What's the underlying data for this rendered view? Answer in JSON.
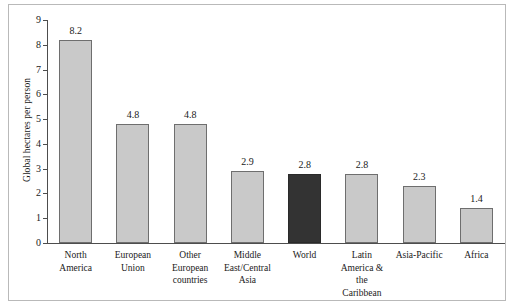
{
  "chart_data": {
    "type": "bar",
    "title": "",
    "xlabel": "",
    "ylabel": "Global hectares per person",
    "ylim": [
      0,
      9
    ],
    "yticks": [
      0,
      1,
      2,
      3,
      4,
      5,
      6,
      7,
      8,
      9
    ],
    "grid": false,
    "legend": "none",
    "categories": [
      "North America",
      "European Union",
      "Other European countries",
      "Middle East/Central Asia",
      "World",
      "Latin America & the Caribbean",
      "Asia-Pacific",
      "Africa"
    ],
    "category_lines": [
      [
        "North",
        "America"
      ],
      [
        "European",
        "Union"
      ],
      [
        "Other",
        "European",
        "countries"
      ],
      [
        "Middle",
        "East/Central",
        "Asia"
      ],
      [
        "World"
      ],
      [
        "Latin",
        "America &",
        "the",
        "Caribbean"
      ],
      [
        "Asia-Pacific"
      ],
      [
        "Africa"
      ]
    ],
    "values": [
      8.2,
      4.8,
      4.8,
      2.9,
      2.8,
      2.8,
      2.3,
      1.4
    ],
    "value_labels": [
      "8.2",
      "4.8",
      "4.8",
      "2.9",
      "2.8",
      "2.8",
      "2.3",
      "1.4"
    ],
    "highlight_index": 4,
    "colors": {
      "bar": "#c9c9c9",
      "bar_border": "#6e6e6e",
      "bar_highlight": "#333333",
      "axis": "#4d4d4d",
      "text": "#1a1a1a",
      "frame": "#b9b9b9",
      "background": "#ffffff"
    }
  }
}
